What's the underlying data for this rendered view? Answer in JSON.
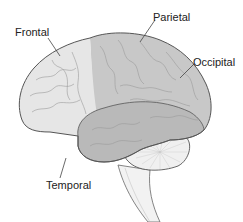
{
  "diagram": {
    "labels": {
      "frontal": "Frontal",
      "parietal": "Parietal",
      "occipital": "Occipital",
      "temporal": "Temporal"
    },
    "colors": {
      "frontal_fill": "#e6e6e6",
      "parietal_occipital_fill": "#c8c8c8",
      "temporal_fill": "#b9b9b9",
      "cerebellum_fill": "#f0f0f0",
      "brainstem_fill": "#f2f2f2",
      "outline": "#555555",
      "sulci": "#9a9a9a",
      "leader_line": "#444444",
      "label_text": "#222222"
    }
  }
}
